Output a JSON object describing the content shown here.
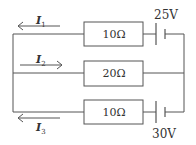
{
  "diagram": {
    "type": "circuit",
    "branches": [
      {
        "id": "top",
        "resistor": "10Ω",
        "battery": "25V",
        "current": {
          "name": "I",
          "sub": "1",
          "direction": "left"
        }
      },
      {
        "id": "middle",
        "resistor": "20Ω",
        "battery": null,
        "current": {
          "name": "I",
          "sub": "2",
          "direction": "right"
        }
      },
      {
        "id": "bottom",
        "resistor": "10Ω",
        "battery": "30V",
        "current": {
          "name": "I",
          "sub": "3",
          "direction": "left"
        }
      }
    ],
    "colors": {
      "line": "#555555",
      "text": "#333333",
      "background": "#ffffff"
    }
  }
}
